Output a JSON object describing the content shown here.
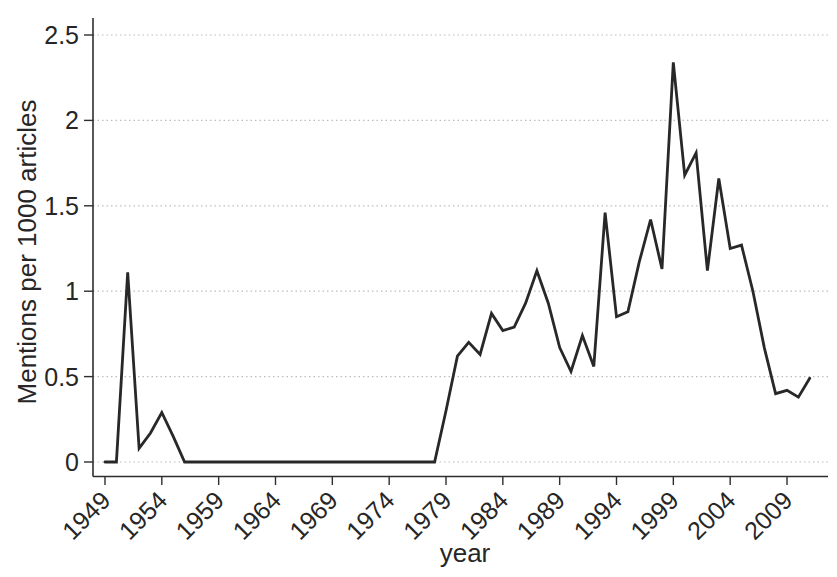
{
  "figure": {
    "background": "#ffffff",
    "line_color": "#282828",
    "axis_color": "#2e2e2e",
    "grid_color": "#bdbdbd",
    "text_color": "#262626"
  },
  "chart_data": {
    "type": "line",
    "title": "",
    "xlabel": "year",
    "ylabel": "Mentions per 1000 articles",
    "xlim": [
      1948,
      2013
    ],
    "ylim": [
      0,
      2.5
    ],
    "grid": "horizontal-dotted",
    "legend": "none",
    "xticks": [
      1949,
      1954,
      1959,
      1964,
      1969,
      1974,
      1979,
      1984,
      1989,
      1994,
      1999,
      2004,
      2009
    ],
    "yticks": [
      0,
      0.5,
      1,
      1.5,
      2,
      2.5
    ],
    "ytick_labels": [
      "0",
      "0.5",
      "1",
      "1.5",
      "2",
      "2.5"
    ],
    "x": [
      1949,
      1950,
      1951,
      1952,
      1953,
      1954,
      1955,
      1956,
      1957,
      1958,
      1959,
      1960,
      1961,
      1962,
      1963,
      1964,
      1965,
      1966,
      1967,
      1968,
      1969,
      1970,
      1971,
      1972,
      1973,
      1974,
      1975,
      1976,
      1977,
      1978,
      1979,
      1980,
      1981,
      1982,
      1983,
      1984,
      1985,
      1986,
      1987,
      1988,
      1989,
      1990,
      1991,
      1992,
      1993,
      1994,
      1995,
      1996,
      1997,
      1998,
      1999,
      2000,
      2001,
      2002,
      2003,
      2004,
      2005,
      2006,
      2007,
      2008,
      2009,
      2010,
      2011
    ],
    "series": [
      {
        "name": "Mentions per 1000 articles",
        "values": [
          0,
          0,
          1.11,
          0.08,
          0.17,
          0.29,
          0.15,
          0,
          0,
          0,
          0,
          0,
          0,
          0,
          0,
          0,
          0,
          0,
          0,
          0,
          0,
          0,
          0,
          0,
          0,
          0,
          0,
          0,
          0,
          0,
          0.3,
          0.62,
          0.7,
          0.63,
          0.87,
          0.77,
          0.79,
          0.93,
          1.12,
          0.93,
          0.67,
          0.53,
          0.74,
          0.56,
          1.46,
          0.85,
          0.88,
          1.17,
          1.42,
          1.13,
          2.34,
          1.68,
          1.81,
          1.12,
          1.66,
          1.25,
          1.27,
          1.0,
          0.67,
          0.4,
          0.42,
          0.38,
          0.49
        ]
      }
    ]
  }
}
